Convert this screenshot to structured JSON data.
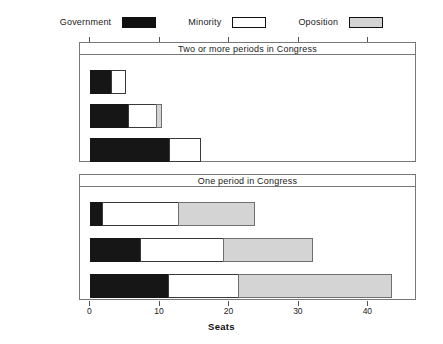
{
  "chart_data": {
    "type": "bar",
    "orientation": "horizontal",
    "stacked": true,
    "title": "",
    "xlabel": "Seats",
    "ylabel": "",
    "xlim": [
      -1.5,
      47
    ],
    "xticks": [
      0,
      10,
      20,
      30,
      40
    ],
    "xticklabels": [
      "0",
      "10",
      "20",
      "30",
      "40"
    ],
    "grid": false,
    "legend": {
      "position": "top",
      "entries": [
        {
          "name": "Government",
          "color": "#161616"
        },
        {
          "name": "Minority",
          "color": "#ffffff"
        },
        {
          "name": "Oposition",
          "color": "#d4d4d4"
        }
      ]
    },
    "panels": [
      {
        "strip_label": "Two or more periods in Congress",
        "categories": [
          "Reelected",
          "Not Reelected",
          "Did not run"
        ],
        "series": [
          {
            "name": "Government",
            "values": [
              3.0,
              5.4,
              11.3
            ]
          },
          {
            "name": "Minority",
            "values": [
              2.0,
              4.0,
              4.4
            ]
          },
          {
            "name": "Oposition",
            "values": [
              0.0,
              0.7,
              0.0
            ]
          }
        ],
        "totals": [
          5.0,
          10.1,
          15.7
        ]
      },
      {
        "strip_label": "One period in Congress",
        "categories": [
          "Reelected",
          "Not Reelected",
          "Did not run"
        ],
        "series": [
          {
            "name": "Government",
            "values": [
              1.7,
              7.2,
              11.2
            ]
          },
          {
            "name": "Minority",
            "values": [
              10.9,
              11.9,
              10.0
            ]
          },
          {
            "name": "Oposition",
            "values": [
              11.0,
              12.8,
              22.0
            ]
          }
        ],
        "totals": [
          23.6,
          31.9,
          43.2
        ]
      }
    ]
  }
}
